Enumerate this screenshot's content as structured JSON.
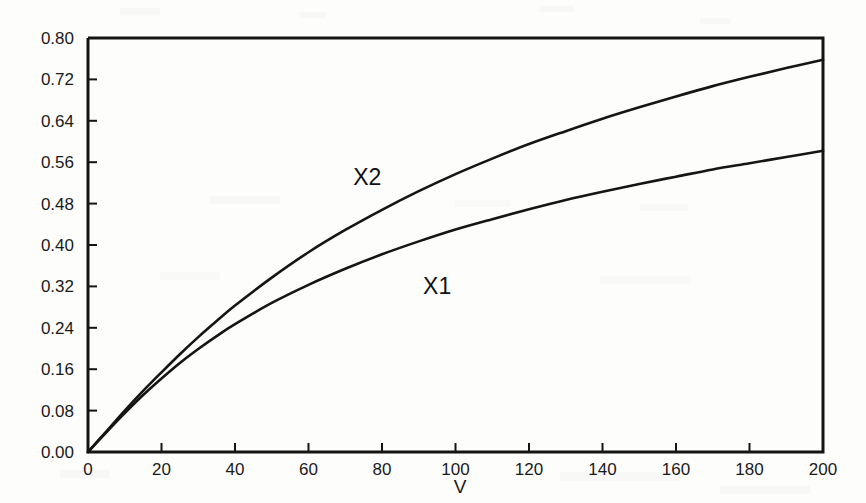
{
  "chart_data": {
    "type": "line",
    "title": "",
    "subtitle": "",
    "xlabel": "V",
    "ylabel": "",
    "xlim": [
      0,
      200
    ],
    "ylim": [
      0.0,
      0.8
    ],
    "grid": false,
    "legend_position": "inline-annotations",
    "x_ticks": [
      0,
      20,
      40,
      60,
      80,
      100,
      120,
      140,
      160,
      180,
      200
    ],
    "x_tick_labels": [
      "0",
      "20",
      "40",
      "60",
      "80",
      "100",
      "120",
      "140",
      "160",
      "180",
      "200"
    ],
    "y_ticks": [
      0.0,
      0.08,
      0.16,
      0.24,
      0.32,
      0.4,
      0.48,
      0.56,
      0.64,
      0.72,
      0.8
    ],
    "y_tick_labels": [
      "0.00",
      "0.08",
      "0.16",
      "0.24",
      "0.32",
      "0.40",
      "0.48",
      "0.56",
      "0.64",
      "0.72",
      "0.80"
    ],
    "x": [
      0,
      5,
      10,
      15,
      20,
      25,
      30,
      35,
      40,
      50,
      60,
      70,
      80,
      90,
      100,
      110,
      120,
      130,
      140,
      150,
      160,
      170,
      180,
      190,
      200
    ],
    "series": [
      {
        "name": "X1",
        "label": "X1",
        "label_x": 95,
        "label_y": 0.305,
        "color": "#151515",
        "values": [
          0.0,
          0.038,
          0.075,
          0.11,
          0.142,
          0.172,
          0.199,
          0.224,
          0.247,
          0.288,
          0.323,
          0.354,
          0.382,
          0.407,
          0.43,
          0.45,
          0.469,
          0.487,
          0.503,
          0.518,
          0.532,
          0.546,
          0.558,
          0.57,
          0.582
        ]
      },
      {
        "name": "X2",
        "label": "X2",
        "label_x": 76,
        "label_y": 0.515,
        "color": "#151515",
        "values": [
          0.0,
          0.04,
          0.08,
          0.118,
          0.154,
          0.189,
          0.222,
          0.253,
          0.283,
          0.337,
          0.386,
          0.429,
          0.468,
          0.504,
          0.537,
          0.567,
          0.595,
          0.62,
          0.644,
          0.666,
          0.687,
          0.707,
          0.725,
          0.742,
          0.758
        ]
      }
    ]
  },
  "annotations": {
    "x_axis_label": "V"
  }
}
